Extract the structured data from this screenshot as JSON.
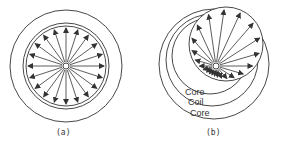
{
  "figures": [
    {
      "id": "a",
      "caption": "(a)"
    },
    {
      "id": "b",
      "caption": "(b)",
      "labels": [
        "Core",
        "Coil",
        "Core"
      ]
    }
  ],
  "colors": {
    "line": "#333333",
    "background": "#ffffff"
  }
}
